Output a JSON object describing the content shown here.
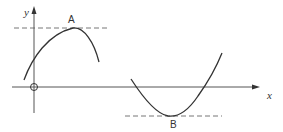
{
  "diagram": {
    "type": "function-graph",
    "axes": {
      "x_label": "x",
      "y_label": "y",
      "origin_marker": "circle"
    },
    "points": {
      "maximum": {
        "label": "A"
      },
      "minimum": {
        "label": "B"
      }
    },
    "colors": {
      "curve": "#333333",
      "axis": "#555555",
      "dashed": "#777777",
      "background": "#ffffff"
    }
  }
}
